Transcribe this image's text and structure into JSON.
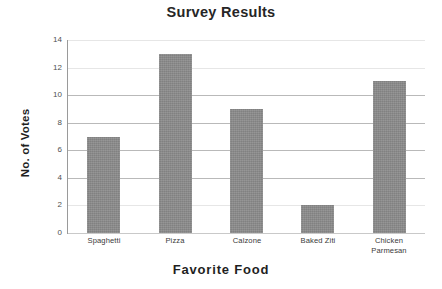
{
  "chart_data": {
    "type": "bar",
    "title": "Survey Results",
    "xlabel": "Favorite Food",
    "ylabel": "No. of Votes",
    "categories": [
      "Spaghetti",
      "Pizza",
      "Calzone",
      "Baked Ziti",
      "Chicken Parmesan"
    ],
    "category_label_lines": [
      [
        "Spaghetti"
      ],
      [
        "Pizza"
      ],
      [
        "Calzone"
      ],
      [
        "Baked Ziti"
      ],
      [
        "Chicken",
        "Parmesan"
      ]
    ],
    "values": [
      7,
      13,
      9,
      2,
      11
    ],
    "ylim": [
      0,
      14
    ],
    "ytick_labels": [
      "0",
      "2",
      "4",
      "6",
      "8",
      "10",
      "12",
      "14"
    ],
    "ytick_values": [
      0,
      2,
      4,
      6,
      8,
      10,
      12,
      14
    ],
    "ystep": 2,
    "grid": true,
    "gridline_values": [
      4,
      6,
      8,
      10
    ],
    "legend": "none",
    "bar_color": "#8a8a8a",
    "background_color": "#ffffff",
    "axis_color": "#9a9a9a",
    "grid_color": "#b9b9b9",
    "text_color": "#262626"
  }
}
